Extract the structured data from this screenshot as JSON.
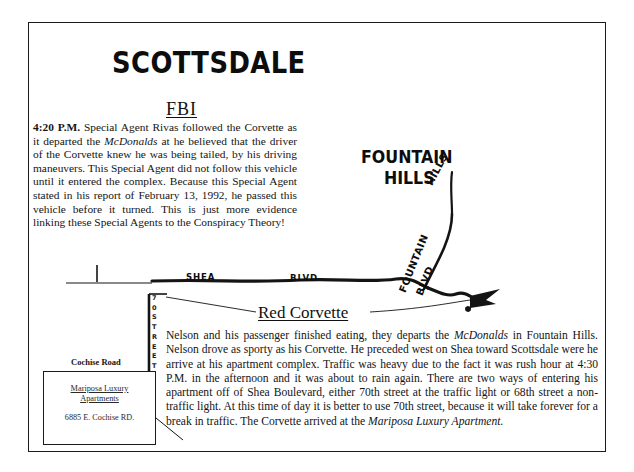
{
  "document": {
    "title": "SCOTTSDALE"
  },
  "fbi_section": {
    "heading": "FBI",
    "lead": "4:20 P.M.",
    "body_part1": " Special Agent Rivas followed the Corvette as it departed the ",
    "italic1": "McDonalds",
    "body_part2": " at he believed that the driver of the Corvette knew he was being tailed, by his driving maneuvers. This Special Agent did not follow this vehicle until it entered the complex. Because this Special Agent stated in his report of February 13, 1992, he passed this vehicle before it turned. This is just more evidence linking these Special Agents to the Conspiracy Theory!"
  },
  "map": {
    "fountain_hills_line1": "FOUNTAIN",
    "fountain_hills_line2": "HILLS",
    "hills_diagonal": "HILLS",
    "shea_label": "SHEA",
    "blvd_label": "BLVD",
    "fountain_diagonal": "FOUNTAIN",
    "blvd_diagonal": "BLVD",
    "street_70_chars": [
      "7",
      "0",
      "",
      "S",
      "T",
      "R",
      "E",
      "E",
      "T"
    ],
    "cochise_road_label": "Cochise Road",
    "mariposa_name_line1": "Mariposa Luxury",
    "mariposa_name_line2": "Apartments",
    "mariposa_address": "6885 E. Cochise RD."
  },
  "corvette_section": {
    "heading": "Red Corvette",
    "body_part1": "Nelson and his passenger finished eating, they departs the ",
    "italic1": "McDonalds",
    "body_part2": " in Fountain Hills. Nelson drove as sporty as his Corvette. He preceded west on Shea toward Scottsdale were he arrive at his apartment complex. Traffic was heavy due to the fact it was rush hour at 4:30 P.M. in the afternoon and it was about to rain again. There are two ways of entering his apartment off of Shea Boulevard, either 70th street at the traffic light or 68th street a non-traffic light. At this time of day it is better to use 70th street, because it will take forever for a break in traffic. The Corvette arrived at the ",
    "italic2": "Mariposa Luxury Apartment."
  },
  "colors": {
    "ink": "#111111",
    "paper": "#ffffff"
  }
}
